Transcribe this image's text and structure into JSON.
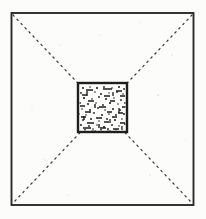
{
  "figure": {
    "medium": "scanned ink line drawing",
    "canvas": {
      "width": 206,
      "height": 219,
      "background_color": "#fcfcfa"
    },
    "elements": {
      "outer_frame": {
        "label": "outer square enclosure wall",
        "shape": "square",
        "stroke_color": "#2b2b2b",
        "stroke_width": 1.9,
        "fill": "none",
        "x": 11.5,
        "y": 13.0,
        "width": 182.0,
        "height": 192.0
      },
      "diagonals": {
        "label": "dashed corner-to-corner construction diagonals",
        "stroke_color": "#3a3a3a",
        "stroke_width": 1.25,
        "dash_pattern": "1.6 4.2",
        "count": 2,
        "lines": [
          {
            "name": "diagonal-top-left-to-bottom-right",
            "x1": 13.0,
            "y1": 15.0,
            "x2": 192.0,
            "y2": 203.0
          },
          {
            "name": "diagonal-top-right-to-bottom-left",
            "x1": 192.0,
            "y1": 15.0,
            "x2": 13.0,
            "y2": 203.0
          }
        ]
      },
      "inner_square": {
        "label": "central chamber with stone rubble fill",
        "shape": "square",
        "stroke_color": "#1e1e1e",
        "stroke_width": 2.4,
        "fill_color": "#fefefd",
        "fill_texture": "stippled rubble — irregular dots and short dashes",
        "x": 78.0,
        "y": 83.0,
        "width": 49.0,
        "height": 49.0
      }
    },
    "colors": {
      "paper": "#fcfcfa",
      "ink_dark": "#1c1c1c",
      "ink_frame": "#2b2b2b",
      "ink_dashed": "#3a3a3a",
      "grain": "#9a9a93"
    },
    "texture": {
      "dots": [
        [
          83,
          88,
          1.0
        ],
        [
          90,
          87,
          0.8
        ],
        [
          97,
          88,
          1.1
        ],
        [
          104,
          87,
          0.9
        ],
        [
          112,
          88,
          0.8
        ],
        [
          119,
          87,
          1.0
        ],
        [
          124,
          89,
          0.9
        ],
        [
          81,
          93,
          0.9
        ],
        [
          95,
          92,
          0.8
        ],
        [
          101,
          94,
          1.0
        ],
        [
          109,
          93,
          0.7
        ],
        [
          117,
          92,
          0.9
        ],
        [
          123,
          94,
          0.8
        ],
        [
          84,
          98,
          1.1
        ],
        [
          92,
          99,
          0.8
        ],
        [
          99,
          97,
          0.9
        ],
        [
          106,
          99,
          1.0
        ],
        [
          114,
          98,
          0.8
        ],
        [
          121,
          100,
          0.9
        ],
        [
          80,
          103,
          0.9
        ],
        [
          88,
          104,
          1.0
        ],
        [
          96,
          103,
          0.8
        ],
        [
          103,
          105,
          0.9
        ],
        [
          110,
          103,
          1.1
        ],
        [
          118,
          104,
          0.8
        ],
        [
          125,
          103,
          0.9
        ],
        [
          82,
          109,
          0.8
        ],
        [
          90,
          110,
          1.0
        ],
        [
          98,
          108,
          0.9
        ],
        [
          105,
          110,
          0.8
        ],
        [
          113,
          109,
          1.0
        ],
        [
          120,
          110,
          0.9
        ],
        [
          79,
          114,
          1.0
        ],
        [
          86,
          115,
          0.8
        ],
        [
          94,
          113,
          0.9
        ],
        [
          102,
          115,
          1.0
        ],
        [
          109,
          114,
          0.8
        ],
        [
          116,
          115,
          0.9
        ],
        [
          124,
          114,
          1.0
        ],
        [
          83,
          120,
          0.9
        ],
        [
          91,
          119,
          1.0
        ],
        [
          99,
          121,
          0.8
        ],
        [
          107,
          119,
          0.9
        ],
        [
          115,
          120,
          1.0
        ],
        [
          122,
          119,
          0.8
        ],
        [
          81,
          125,
          1.0
        ],
        [
          89,
          126,
          0.9
        ],
        [
          97,
          125,
          0.8
        ],
        [
          104,
          127,
          1.0
        ],
        [
          112,
          125,
          0.9
        ],
        [
          119,
          126,
          0.8
        ],
        [
          125,
          124,
          0.9
        ],
        [
          85,
          130,
          0.9
        ],
        [
          93,
          129,
          0.8
        ],
        [
          101,
          130,
          1.0
        ],
        [
          108,
          129,
          0.9
        ],
        [
          116,
          130,
          0.8
        ]
      ],
      "dashes": [
        [
          86,
          90,
          7,
          1.6
        ],
        [
          103,
          89,
          9,
          1.4
        ],
        [
          116,
          91,
          6,
          1.5
        ],
        [
          82,
          95,
          5,
          1.3
        ],
        [
          104,
          96,
          6,
          1.5
        ],
        [
          120,
          96,
          5,
          1.4
        ],
        [
          88,
          101,
          6,
          1.5
        ],
        [
          110,
          101,
          5,
          1.3
        ],
        [
          80,
          106,
          5,
          1.4
        ],
        [
          99,
          107,
          7,
          1.5
        ],
        [
          122,
          107,
          4,
          1.4
        ],
        [
          85,
          112,
          6,
          1.4
        ],
        [
          107,
          112,
          5,
          1.5
        ],
        [
          118,
          113,
          5,
          1.3
        ],
        [
          81,
          117,
          5,
          1.5
        ],
        [
          96,
          118,
          6,
          1.4
        ],
        [
          112,
          117,
          5,
          1.5
        ],
        [
          87,
          123,
          7,
          1.5
        ],
        [
          104,
          122,
          5,
          1.3
        ],
        [
          120,
          123,
          5,
          1.5
        ],
        [
          83,
          128,
          8,
          1.6
        ],
        [
          100,
          128,
          6,
          1.4
        ],
        [
          113,
          129,
          6,
          1.5
        ],
        [
          91,
          131,
          5,
          1.4
        ],
        [
          107,
          131,
          4,
          1.3
        ]
      ],
      "vertical_dashes": [
        [
          87,
          91,
          5,
          1.4
        ],
        [
          113,
          92,
          4,
          1.3
        ],
        [
          95,
          104,
          4,
          1.4
        ],
        [
          119,
          108,
          5,
          1.3
        ],
        [
          84,
          116,
          4,
          1.4
        ],
        [
          110,
          119,
          4,
          1.3
        ],
        [
          99,
          124,
          4,
          1.4
        ],
        [
          122,
          126,
          4,
          1.3
        ]
      ]
    }
  }
}
